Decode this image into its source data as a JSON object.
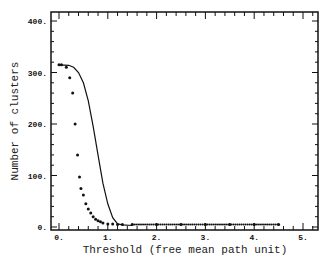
{
  "chart_data": {
    "type": "scatter",
    "title": "",
    "xlabel": "Threshold (free mean path unit)",
    "ylabel": "Number of clusters",
    "xlim": [
      -0.1,
      5.2
    ],
    "ylim": [
      -5,
      415
    ],
    "xticks": [
      "0.",
      "1.",
      "2.",
      "3.",
      "4.",
      "5."
    ],
    "yticks": [
      "0.",
      "100.",
      "200.",
      "300.",
      "400."
    ],
    "grid": false,
    "legend": null,
    "series": [
      {
        "name": "points",
        "style": "dots",
        "x": [
          0.0,
          0.05,
          0.15,
          0.22,
          0.28,
          0.33,
          0.38,
          0.42,
          0.45,
          0.5,
          0.55,
          0.6,
          0.65,
          0.7,
          0.75,
          0.8,
          0.85,
          0.9,
          1.0,
          1.1,
          1.2,
          1.3,
          1.5,
          2.0,
          2.5,
          3.0,
          3.5,
          4.0,
          4.5
        ],
        "y": [
          315,
          315,
          310,
          290,
          260,
          200,
          140,
          97,
          75,
          62,
          45,
          35,
          27,
          20,
          15,
          12,
          10,
          8,
          6,
          6,
          5,
          5,
          5,
          5,
          5,
          5,
          5,
          5,
          5
        ]
      },
      {
        "name": "curve",
        "style": "line",
        "x": [
          0.0,
          0.2,
          0.3,
          0.4,
          0.5,
          0.6,
          0.7,
          0.8,
          0.9,
          1.0,
          1.1,
          1.2,
          1.3,
          1.5
        ],
        "y": [
          315,
          314,
          310,
          300,
          280,
          245,
          195,
          140,
          85,
          45,
          18,
          6,
          4,
          3
        ]
      }
    ]
  }
}
